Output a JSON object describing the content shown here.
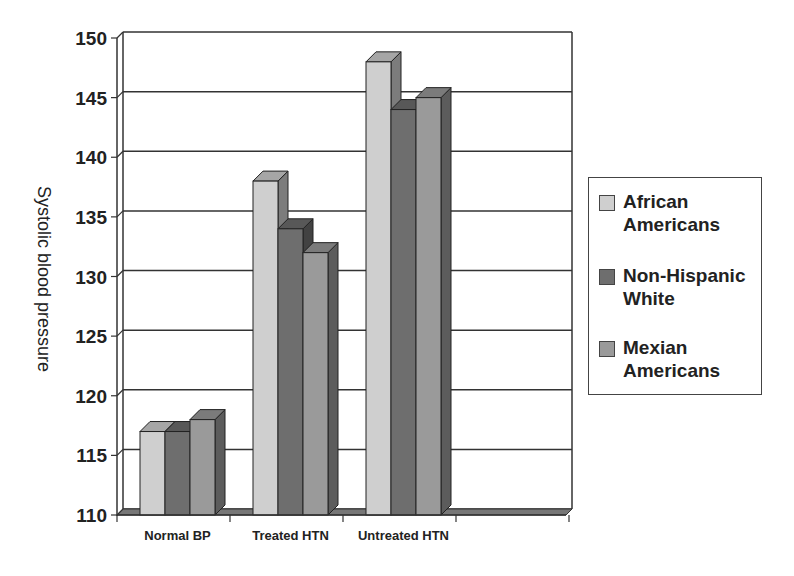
{
  "chart_data": {
    "type": "bar",
    "style": "3d-clustered-column",
    "title": "",
    "xlabel": "",
    "ylabel": "Systolic blood pressure",
    "ylim": [
      110,
      150
    ],
    "yticks": [
      110,
      115,
      120,
      125,
      130,
      135,
      140,
      145,
      150
    ],
    "grid": true,
    "legend_position": "right",
    "categories": [
      "Normal BP",
      "Treated HTN",
      "Untreated HTN",
      ""
    ],
    "series": [
      {
        "name": "African Americans",
        "color": "#cfcfcf",
        "values": [
          117,
          138,
          148,
          null
        ]
      },
      {
        "name": "Non-Hispanic White",
        "color": "#6e6e6e",
        "values": [
          117,
          134,
          144,
          null
        ]
      },
      {
        "name": "Mexian Americans",
        "color": "#9a9a9a",
        "values": [
          118,
          132,
          145,
          null
        ]
      }
    ]
  },
  "legend": {
    "items": [
      {
        "label": "African Americans",
        "color": "#cfcfcf"
      },
      {
        "label": "Non-Hispanic White",
        "color": "#6e6e6e"
      },
      {
        "label": "Mexian Americans",
        "color": "#9a9a9a"
      }
    ]
  }
}
